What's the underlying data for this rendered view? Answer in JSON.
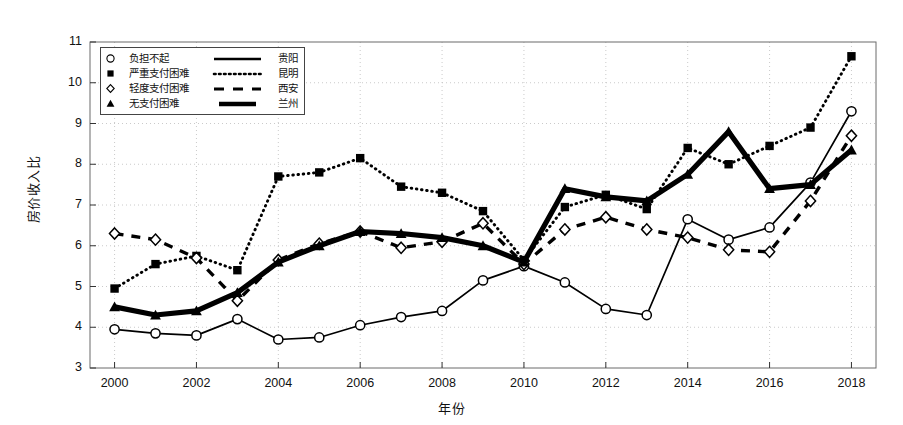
{
  "chart_data": {
    "type": "line",
    "title": "",
    "xlabel": "年份",
    "ylabel": "房价收入比",
    "xlim": [
      1999.4,
      2018.6
    ],
    "ylim": [
      3,
      11
    ],
    "yticks": [
      3,
      4,
      5,
      6,
      7,
      8,
      9,
      10,
      11
    ],
    "xticks": [
      2000,
      2002,
      2004,
      2006,
      2008,
      2010,
      2012,
      2014,
      2016,
      2018
    ],
    "grid": true,
    "grid_style": "dotted",
    "legend_position": "upper-left",
    "x": [
      2000,
      2001,
      2002,
      2003,
      2004,
      2005,
      2006,
      2007,
      2008,
      2009,
      2010,
      2011,
      2012,
      2013,
      2014,
      2015,
      2016,
      2017,
      2018
    ],
    "series": [
      {
        "name": "贵阳",
        "marker": "circle-open",
        "line": "solid",
        "values": [
          3.95,
          3.85,
          3.8,
          4.2,
          3.7,
          3.75,
          4.05,
          4.25,
          4.4,
          5.15,
          5.5,
          5.1,
          4.45,
          4.3,
          6.65,
          6.15,
          6.45,
          7.55,
          9.3
        ]
      },
      {
        "name": "昆明",
        "marker": "square-filled",
        "line": "dotted",
        "values": [
          4.95,
          5.55,
          5.75,
          5.4,
          7.7,
          7.8,
          8.15,
          7.45,
          7.3,
          6.85,
          5.65,
          6.95,
          7.25,
          6.9,
          8.4,
          8.0,
          8.45,
          8.9,
          10.65
        ]
      },
      {
        "name": "西安",
        "marker": "diamond-open",
        "line": "dashed",
        "values": [
          6.3,
          6.15,
          5.7,
          4.65,
          5.65,
          6.05,
          6.35,
          5.95,
          6.1,
          6.55,
          5.55,
          6.4,
          6.7,
          6.4,
          6.2,
          5.9,
          5.85,
          7.1,
          8.7
        ]
      },
      {
        "name": "兰州",
        "marker": "triangle-filled",
        "line": "solid-thick",
        "values": [
          4.5,
          4.3,
          4.4,
          4.85,
          5.6,
          6.0,
          6.35,
          6.3,
          6.2,
          6.0,
          5.6,
          7.4,
          7.2,
          7.1,
          7.75,
          8.8,
          7.4,
          7.5,
          8.35
        ]
      }
    ]
  },
  "legend": {
    "rows": [
      {
        "marker": "circle-open-icon",
        "affordability": "负担不起",
        "city": "贵阳",
        "line": "solid"
      },
      {
        "marker": "square-filled-icon",
        "affordability": "严重支付困难",
        "city": "昆明",
        "line": "dotted"
      },
      {
        "marker": "diamond-open-icon",
        "affordability": "轻度支付困难",
        "city": "西安",
        "line": "dashed"
      },
      {
        "marker": "triangle-filled-icon",
        "affordability": "无支付困难",
        "city": "兰州",
        "line": "solid-thick"
      }
    ]
  },
  "colors": {
    "ink": "#000000",
    "background": "#ffffff",
    "grid": "#bdbdbd",
    "frame": "#6b6b6b"
  }
}
